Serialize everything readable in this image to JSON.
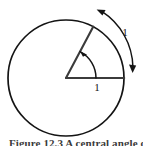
{
  "figure": {
    "kind": "geometry-diagram",
    "background_color": "#ffffff",
    "stroke_color": "#141414",
    "circle": {
      "center_x": 66,
      "center_y": 78,
      "radius": 58,
      "stroke_width": 1.6
    },
    "radius_horizontal": {
      "label": "1",
      "label_x": 97,
      "label_y": 90,
      "from_x": 66,
      "from_y": 78,
      "to_x": 124,
      "to_y": 78
    },
    "radius_slanted": {
      "from_x": 66,
      "from_y": 78,
      "to_x": 93,
      "to_y": 26,
      "angle_degrees": 62
    },
    "angle_arc": {
      "radius": 30,
      "arrow_direction": "counterclockwise",
      "arrowhead": "at-upper-end"
    },
    "outer_arc_arrow": {
      "label": "1",
      "label_x": 125,
      "label_y": 36,
      "radius": 68,
      "heads": "double",
      "head_top_direction": "counterclockwise-left",
      "head_bottom_direction": "clockwise-down"
    }
  },
  "caption": {
    "text": "Figure 12.3  A central angle of one radian",
    "clipped": true
  }
}
